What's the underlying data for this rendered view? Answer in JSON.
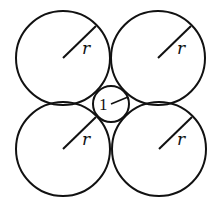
{
  "diagram": {
    "stroke_color": "#111111",
    "background": "#ffffff",
    "large_circles": [
      {
        "id": "top-left",
        "cx": 63,
        "cy": 58,
        "r": 47,
        "label": "r",
        "radius_end": [
          95,
          36
        ],
        "label_pos": [
          84,
          51
        ]
      },
      {
        "id": "top-right",
        "cx": 158,
        "cy": 58,
        "r": 47,
        "label": "r",
        "radius_end": [
          190,
          36
        ],
        "label_pos": [
          178,
          51
        ]
      },
      {
        "id": "bottom-left",
        "cx": 63,
        "cy": 149,
        "r": 47,
        "label": "r",
        "radius_end": [
          95,
          117
        ],
        "label_pos": [
          84,
          142
        ]
      },
      {
        "id": "bottom-right",
        "cx": 159,
        "cy": 149,
        "r": 47,
        "label": "r",
        "radius_end": [
          191,
          117
        ],
        "label_pos": [
          178,
          142
        ]
      }
    ],
    "small_circle": {
      "id": "center",
      "cx": 111,
      "cy": 104,
      "r": 18,
      "label": "1",
      "radius_end": [
        127,
        97
      ],
      "label_pos": [
        100,
        111
      ]
    }
  }
}
